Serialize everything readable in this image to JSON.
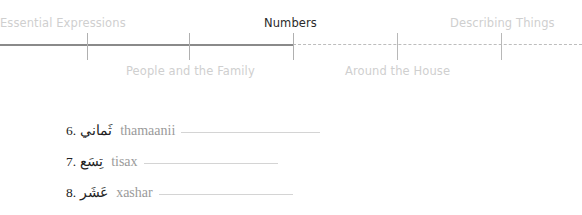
{
  "nav": {
    "top_labels": [
      {
        "label": "Essential Expressions",
        "state": "done"
      },
      {
        "label": "Numbers",
        "state": "current"
      },
      {
        "label": "Describing Things",
        "state": "upcoming"
      }
    ],
    "bottom_labels": [
      {
        "label": "People and the Family",
        "state": "done"
      },
      {
        "label": "Around the House",
        "state": "upcoming"
      }
    ],
    "progress_colors": {
      "done": "#8a8a8a",
      "upcoming": "#bdbdbd",
      "current_text": "#2a2a2a",
      "inactive_text": "#cfcfcf"
    }
  },
  "exercise": {
    "items": [
      {
        "number": "6.",
        "arabic": "ثَماني",
        "transliteration": "thamaanii",
        "answer": ""
      },
      {
        "number": "7.",
        "arabic": "تِسَع",
        "transliteration": "tisax",
        "answer": ""
      },
      {
        "number": "8.",
        "arabic": "عَشَر",
        "transliteration": "xashar",
        "answer": ""
      }
    ]
  }
}
